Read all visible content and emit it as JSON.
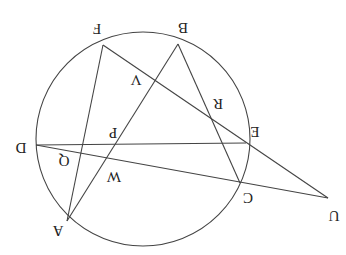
{
  "diagram": {
    "orientation": "rotated 180 degrees",
    "circle": {
      "cx": 143,
      "cy": 139,
      "r": 107
    },
    "points": {
      "A": {
        "x": 67,
        "y": 221,
        "label": "A"
      },
      "B": {
        "x": 178,
        "y": 44,
        "label": "B"
      },
      "C": {
        "x": 240,
        "y": 183,
        "label": "C"
      },
      "D": {
        "x": 36,
        "y": 145,
        "label": "D"
      },
      "E": {
        "x": 246,
        "y": 143,
        "label": "E"
      },
      "F": {
        "x": 103,
        "y": 45,
        "label": "F"
      },
      "U": {
        "x": 328,
        "y": 198,
        "label": "U"
      },
      "P": {
        "x": 115,
        "y": 143,
        "label": "P"
      },
      "Q": {
        "x": 80,
        "y": 153,
        "label": "Q"
      },
      "W": {
        "x": 107,
        "y": 157,
        "label": "W"
      },
      "V": {
        "x": 152,
        "y": 82,
        "label": "V"
      },
      "R": {
        "x": 212,
        "y": 117,
        "label": "R"
      }
    },
    "segments": [
      [
        "F",
        "A"
      ],
      [
        "F",
        "U"
      ],
      [
        "B",
        "A"
      ],
      [
        "B",
        "C"
      ],
      [
        "D",
        "E"
      ],
      [
        "D",
        "U"
      ]
    ],
    "labels": {
      "A": "A",
      "B": "B",
      "C": "C",
      "D": "D",
      "E": "E",
      "F": "F",
      "U": "U",
      "P": "P",
      "Q": "Q",
      "W": "W",
      "V": "V",
      "R": "R"
    }
  }
}
